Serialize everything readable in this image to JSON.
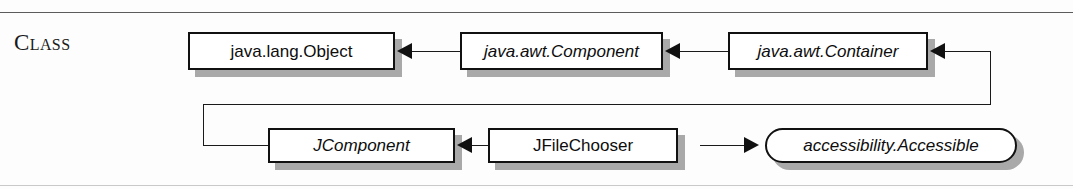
{
  "sidebar": {
    "section_label": "Class"
  },
  "diagram": {
    "type": "class-hierarchy",
    "nodes": [
      {
        "id": "object",
        "label": "java.lang.Object",
        "kind": "class",
        "style": "upright"
      },
      {
        "id": "component",
        "label": "java.awt.Component",
        "kind": "abstract-class",
        "style": "italic"
      },
      {
        "id": "container",
        "label": "java.awt.Container",
        "kind": "abstract-class",
        "style": "italic"
      },
      {
        "id": "jcomponent",
        "label": "JComponent",
        "kind": "abstract-class",
        "style": "italic"
      },
      {
        "id": "jfilechooser",
        "label": "JFileChooser",
        "kind": "class",
        "style": "upright"
      },
      {
        "id": "accessible",
        "label": "accessibility.Accessible",
        "kind": "interface",
        "style": "italic"
      }
    ],
    "edges": [
      {
        "from": "component",
        "to": "object",
        "relation": "extends"
      },
      {
        "from": "container",
        "to": "component",
        "relation": "extends"
      },
      {
        "from": "jcomponent",
        "to": "container",
        "relation": "extends"
      },
      {
        "from": "jfilechooser",
        "to": "jcomponent",
        "relation": "extends"
      },
      {
        "from": "jfilechooser",
        "to": "accessible",
        "relation": "implements"
      }
    ]
  },
  "colors": {
    "node_border": "#111111",
    "node_fill": "#ffffff",
    "shadow": "#a9a9a9",
    "rule": "#5c5c5c",
    "text": "#0d0d0d"
  }
}
